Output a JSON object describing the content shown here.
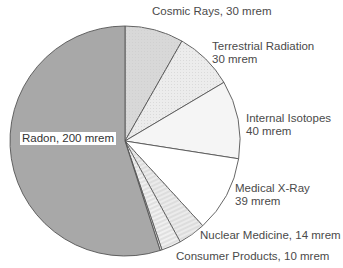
{
  "chart_data": {
    "type": "pie",
    "title": "",
    "unit": "mrem",
    "start_angle_deg": 0,
    "direction": "clockwise",
    "slices": [
      {
        "name": "Cosmic Rays",
        "value": 30,
        "color": "#d8d8d8",
        "pattern": "dots"
      },
      {
        "name": "Terrestrial Radiation",
        "value": 30,
        "color": "#ececec",
        "pattern": "dots"
      },
      {
        "name": "Internal Isotopes",
        "value": 40,
        "color": "#f5f5f5",
        "pattern": "none"
      },
      {
        "name": "Medical X-Ray",
        "value": 39,
        "color": "#ffffff",
        "pattern": "none"
      },
      {
        "name": "Nuclear Medicine",
        "value": 14,
        "color": "#ebebeb",
        "pattern": "stripes"
      },
      {
        "name": "Consumer Products",
        "value": 10,
        "color": "#f0f0f0",
        "pattern": "stripes"
      },
      {
        "name": "",
        "value": 1,
        "color": "#dcdcdc",
        "pattern": "none"
      },
      {
        "name": "Radon",
        "value": 200,
        "color": "#a8a8a8",
        "pattern": "none"
      }
    ],
    "labels": {
      "cosmic": "Cosmic Rays, 30 mrem",
      "terrestrial_1": "Terrestrial Radiation",
      "terrestrial_2": "30 mrem",
      "internal_1": "Internal Isotopes",
      "internal_2": "40 mrem",
      "medical_1": "Medical X-Ray",
      "medical_2": "39 mrem",
      "nuclear": "Nuclear Medicine, 14 mrem",
      "consumer": "Consumer Products, 10 mrem",
      "radon": "Radon, 200 mrem"
    },
    "legend": "none",
    "stroke_color": "#555555"
  }
}
